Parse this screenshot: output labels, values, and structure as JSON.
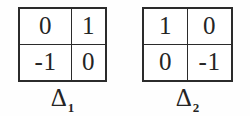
{
  "figure": {
    "background_color": "#fefefe",
    "ink_color": "#242424",
    "matrices": [
      {
        "id": "matrix-1",
        "label_symbol": "Δ",
        "label_subscript": "1",
        "label_full": "Δ1",
        "rows": [
          [
            "0",
            "1"
          ],
          [
            "-1",
            "0"
          ]
        ]
      },
      {
        "id": "matrix-2",
        "label_symbol": "Δ",
        "label_subscript": "2",
        "label_full": "Δ2",
        "rows": [
          [
            "1",
            "0"
          ],
          [
            "0",
            "-1"
          ]
        ]
      }
    ]
  }
}
